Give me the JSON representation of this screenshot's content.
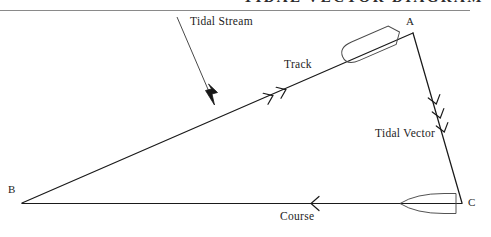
{
  "page": {
    "width": 491,
    "height": 237,
    "background": "#ffffff",
    "ink_color": "#1a1a1a",
    "rule_color": "#7a7a7a"
  },
  "header": {
    "title": "TIDAL VECTOR DIAGRAM",
    "title_clipped": true,
    "rule_y": 10
  },
  "diagram": {
    "type": "vector-triangle",
    "vertices": [
      {
        "id": "B",
        "label": "B",
        "x": 22,
        "y": 203,
        "label_x": 8,
        "label_y": 186
      },
      {
        "id": "A",
        "label": "A",
        "x": 413,
        "y": 33,
        "label_x": 407,
        "label_y": 17
      },
      {
        "id": "C",
        "label": "C",
        "x": 462,
        "y": 203,
        "label_x": 468,
        "label_y": 196
      }
    ],
    "edges": [
      {
        "id": "track",
        "label": "Track",
        "from": "B",
        "to": "A",
        "direction": "B-to-A",
        "tick_marks": 2,
        "tick_style": "chevron",
        "label_x": 283,
        "label_y": 59
      },
      {
        "id": "tidal-vector",
        "label": "Tidal Vector",
        "from": "A",
        "to": "C",
        "direction": "A-to-C",
        "tick_marks": 3,
        "tick_style": "chevron",
        "label_x": 375,
        "label_y": 129
      },
      {
        "id": "course",
        "label": "Course",
        "from": "C",
        "to": "B",
        "direction": "C-to-B",
        "tick_marks": 1,
        "tick_style": "chevron",
        "label_x": 280,
        "label_y": 211
      }
    ],
    "annotations": [
      {
        "id": "tidal-stream",
        "label": "Tidal Stream",
        "arrow_from_x": 177,
        "arrow_from_y": 17,
        "arrow_to_x": 214,
        "arrow_to_y": 104,
        "arrow_head": "solid-filled",
        "label_x": 190,
        "label_y": 17
      }
    ],
    "vessels": [
      {
        "id": "boat-on-track",
        "name": "boat-hull-track",
        "cx": 372,
        "cy": 44,
        "length": 60,
        "beam": 21,
        "heading_deg": -23.5,
        "bow": "right"
      },
      {
        "id": "boat-on-course",
        "name": "boat-hull-course",
        "cx": 430,
        "cy": 204,
        "length": 60,
        "beam": 20,
        "heading_deg": 0,
        "bow": "left"
      }
    ]
  }
}
